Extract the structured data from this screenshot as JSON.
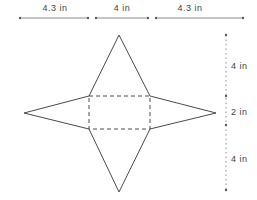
{
  "figure": {
    "background_color": "#ffffff",
    "shape_line_color": "#4a4a4a",
    "dim_line_color": "#8c8c8c",
    "text_color": "#3f3f3f",
    "labels": {
      "top_left": "4.3 in",
      "top_middle": "4 in",
      "top_right": "4.3 in",
      "right_top": "4 in",
      "right_middle": "2 in",
      "right_bottom": "4 in"
    },
    "label_positions": {
      "top_left": {
        "x": 55,
        "y": 8
      },
      "top_middle": {
        "x": 122,
        "y": 8
      },
      "top_right": {
        "x": 190,
        "y": 8
      },
      "right_top": {
        "x": 231,
        "y": 66
      },
      "right_middle": {
        "x": 231,
        "y": 112
      },
      "right_bottom": {
        "x": 231,
        "y": 159
      }
    },
    "geometry": {
      "canvas": {
        "width": 257,
        "height": 200
      },
      "dashed_rect": {
        "x": 89,
        "y": 96,
        "width": 61,
        "height": 33
      },
      "solid_edges": [
        [
          119,
          35,
          89,
          96
        ],
        [
          119,
          35,
          150,
          96
        ],
        [
          24,
          113,
          89,
          96
        ],
        [
          24,
          113,
          89,
          129
        ],
        [
          216,
          113,
          150,
          96
        ],
        [
          216,
          113,
          150,
          129
        ],
        [
          119,
          192,
          89,
          129
        ],
        [
          119,
          192,
          150,
          129
        ]
      ],
      "dimension_lines": [
        {
          "x1": 20,
          "y1": 18,
          "x2": 88,
          "y2": 18,
          "style": "solid"
        },
        {
          "x1": 96,
          "y1": 18,
          "x2": 148,
          "y2": 18,
          "style": "solid"
        },
        {
          "x1": 156,
          "y1": 18,
          "x2": 243,
          "y2": 18,
          "style": "solid"
        },
        {
          "x1": 226,
          "y1": 35,
          "x2": 226,
          "y2": 190,
          "style": "dotted"
        }
      ],
      "ticks": [
        [
          20,
          18
        ],
        [
          88,
          18
        ],
        [
          96,
          18
        ],
        [
          148,
          18
        ],
        [
          156,
          18
        ],
        [
          243,
          18
        ],
        [
          226,
          35
        ],
        [
          226,
          96
        ],
        [
          226,
          125
        ],
        [
          226,
          190
        ]
      ]
    }
  }
}
